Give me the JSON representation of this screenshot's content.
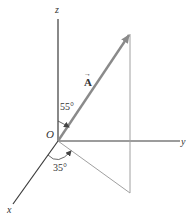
{
  "diagram": {
    "type": "3d-vector-components",
    "colors": {
      "axis": "#3a3a3a",
      "vector": "#8a8a8a",
      "guide": "#a0a0a0",
      "text": "#333333"
    },
    "axes": {
      "z_label": "z",
      "y_label": "y",
      "x_label": "x",
      "origin_label": "O"
    },
    "vector": {
      "label": "A",
      "arrow_glyph": "→"
    },
    "angles": {
      "from_z": "55°",
      "from_x": "35°"
    }
  }
}
